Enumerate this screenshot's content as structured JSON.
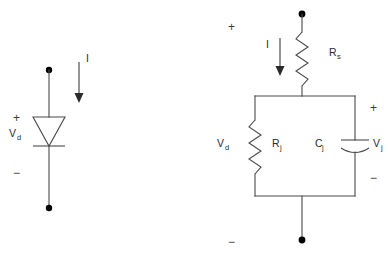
{
  "figure": {
    "background_color": "#ffffff",
    "line_color": "#4a4a4a",
    "text_color": "#2b2b2b",
    "node_color": "#000000"
  },
  "circuits": [
    {
      "id": "diode-symbol",
      "name": "Ideal diode symbol",
      "components": [
        {
          "type": "diode",
          "name": "diode",
          "orientation": "anode-top-cathode-bottom"
        }
      ],
      "labels": {
        "voltage": "V",
        "voltage_sub": "d",
        "current": "I",
        "plus": "+",
        "minus": "−"
      }
    },
    {
      "id": "diode-equivalent-model",
      "name": "Diode equivalent circuit model",
      "components": [
        {
          "type": "resistor",
          "name": "series-resistance",
          "label": "R",
          "label_sub": "s",
          "position": "series-top"
        },
        {
          "type": "resistor",
          "name": "junction-resistance",
          "label": "R",
          "label_sub": "j",
          "position": "parallel-left"
        },
        {
          "type": "capacitor",
          "name": "junction-capacitance",
          "label": "C",
          "label_sub": "j",
          "position": "parallel-right",
          "style": "curved-plate"
        }
      ],
      "labels": {
        "total_voltage": "V",
        "total_voltage_sub": "d",
        "junction_voltage": "V",
        "junction_voltage_sub": "j",
        "current": "I",
        "plus_outer": "+",
        "minus_outer": "−",
        "plus_inner": "+",
        "minus_inner": "−"
      }
    }
  ]
}
